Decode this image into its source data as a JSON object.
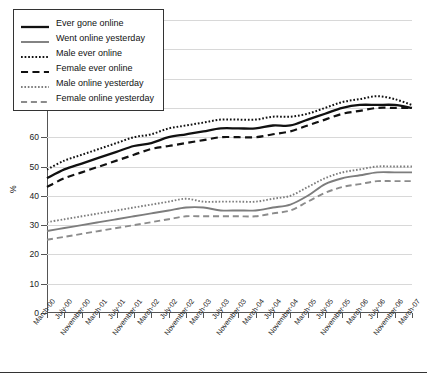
{
  "chart_data": {
    "type": "line",
    "title": "",
    "xlabel": "",
    "ylabel": "%",
    "ylim": [
      0,
      100
    ],
    "ytick_step": 10,
    "yticks": [
      0,
      10,
      20,
      30,
      40,
      50,
      60,
      70,
      80,
      90,
      100
    ],
    "grid": true,
    "legend_position": "top-left",
    "categories": [
      "March-00",
      "July-00",
      "November-00",
      "March-01",
      "July-01",
      "November-01",
      "March-02",
      "July-02",
      "November-02",
      "March-03",
      "July-03",
      "November-03",
      "March-04",
      "July-04",
      "November-04",
      "March-05",
      "July-05",
      "November-05",
      "March-06",
      "July-06",
      "November-06",
      "March-07"
    ],
    "series": [
      {
        "name": "Ever gone online",
        "style": "solid",
        "color": "#111111",
        "width": 2.3,
        "values": [
          46,
          49,
          51,
          53,
          55,
          57,
          58,
          60,
          61,
          62,
          63,
          63,
          63,
          64,
          64,
          66,
          68,
          70,
          71,
          71,
          71,
          70
        ]
      },
      {
        "name": "Went online yesterday",
        "style": "solid",
        "color": "#7d7d7d",
        "width": 1.9,
        "values": [
          28,
          29,
          30,
          31,
          32,
          33,
          34,
          35,
          36,
          36,
          35,
          35,
          35,
          36,
          37,
          40,
          44,
          46,
          47,
          48,
          48,
          48
        ]
      },
      {
        "name": "Male ever online",
        "style": "dotted",
        "color": "#111111",
        "width": 2.0,
        "values": [
          49,
          52,
          54,
          56,
          58,
          60,
          61,
          63,
          64,
          65,
          66,
          66,
          66,
          67,
          67,
          68,
          70,
          72,
          73,
          74,
          73,
          71
        ]
      },
      {
        "name": "Female ever online",
        "style": "dashed",
        "color": "#111111",
        "width": 2.2,
        "values": [
          43,
          46,
          48,
          50,
          52,
          54,
          56,
          57,
          58,
          59,
          60,
          60,
          60,
          61,
          62,
          64,
          66,
          68,
          69,
          70,
          70,
          70
        ]
      },
      {
        "name": "Male online yesterday",
        "style": "dotted",
        "color": "#7d7d7d",
        "width": 1.9,
        "values": [
          31,
          32,
          33,
          34,
          35,
          36,
          37,
          38,
          39,
          38,
          38,
          38,
          38,
          39,
          40,
          43,
          46,
          48,
          49,
          50,
          50,
          50
        ]
      },
      {
        "name": "Female online yesterday",
        "style": "dashed",
        "color": "#8c8c8c",
        "width": 1.9,
        "values": [
          25,
          26,
          27,
          28,
          29,
          30,
          31,
          32,
          33,
          33,
          33,
          33,
          33,
          34,
          35,
          38,
          41,
          43,
          44,
          45,
          45,
          45
        ]
      }
    ]
  },
  "legend": {
    "items": [
      {
        "label": "Ever gone online"
      },
      {
        "label": "Went online yesterday"
      },
      {
        "label": "Male ever online"
      },
      {
        "label": "Female ever online"
      },
      {
        "label": "Male online yesterday"
      },
      {
        "label": "Female online yesterday"
      }
    ]
  }
}
